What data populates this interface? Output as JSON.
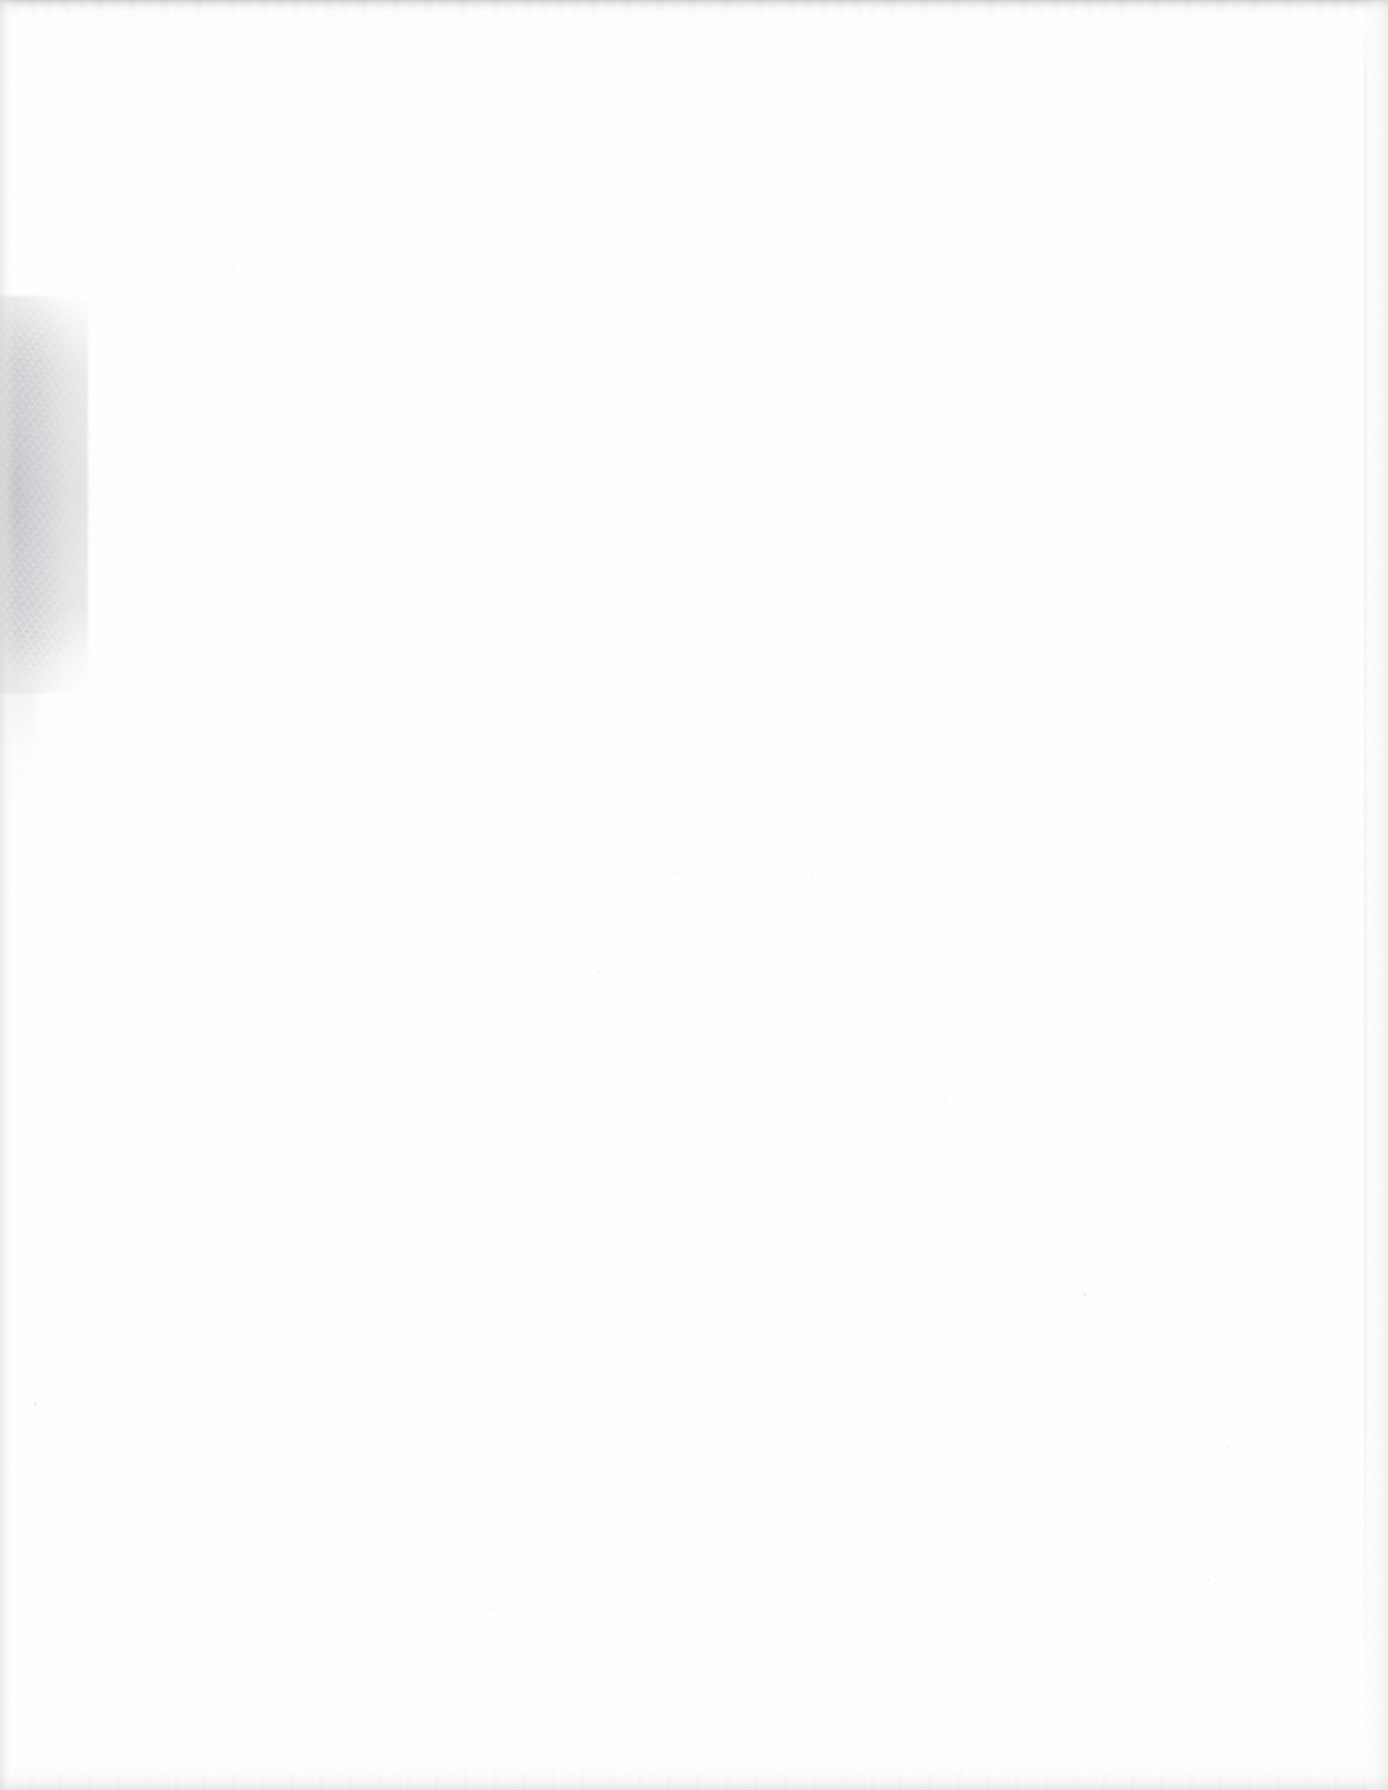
{
  "document": {
    "kind": "scanned-page",
    "page_state": "blank",
    "visible_text": "",
    "caption": "Blank scanned page",
    "dimensions": {
      "width_px": 1388,
      "height_px": 1790
    }
  },
  "colors": {
    "page_background": "#fefefe",
    "paper_white": "#ffffff",
    "edge_band": "#ececec",
    "edge_band_dark": "#c6c6c6",
    "smudge_gray": "#d6d6d8",
    "smudge_core_gray": "#b2b2b8",
    "speck_gray": "#dedede",
    "vignette_gray": "#f7f7f7"
  },
  "artifacts": [
    {
      "name": "top-edge-band",
      "description": "Light gray scan edge band across the top of the page",
      "x": 0,
      "y": 0,
      "width": 1388,
      "height": 14
    },
    {
      "name": "bottom-edge-band",
      "description": "Faint gray scan edge band across the bottom of the page",
      "x": 0,
      "y": 1764,
      "width": 1388,
      "height": 26
    },
    {
      "name": "left-edge-line",
      "description": "Faint vertical gray line along the left margin",
      "x": 0,
      "y": 0,
      "width": 16,
      "height": 1790
    },
    {
      "name": "right-edge-line",
      "description": "Faint vertical gray line along the right margin",
      "x": 1358,
      "y": 0,
      "width": 30,
      "height": 1790
    },
    {
      "name": "left-margin-smudge",
      "description": "Soft mottled gray shadow blotch on the left margin of the scanned page",
      "x": 0,
      "y": 300,
      "width": 88,
      "height": 390
    }
  ],
  "specks": [
    {
      "x": 1083,
      "y": 1293,
      "size": 3
    },
    {
      "x": 34,
      "y": 1402,
      "size": 3
    },
    {
      "x": 36,
      "y": 1500,
      "size": 2
    },
    {
      "x": 232,
      "y": 270,
      "size": 2
    },
    {
      "x": 458,
      "y": 272,
      "size": 2
    },
    {
      "x": 396,
      "y": 1398,
      "size": 2
    },
    {
      "x": 676,
      "y": 872,
      "size": 2
    },
    {
      "x": 810,
      "y": 872,
      "size": 2
    },
    {
      "x": 598,
      "y": 970,
      "size": 2
    },
    {
      "x": 452,
      "y": 1018,
      "size": 2
    },
    {
      "x": 398,
      "y": 1090,
      "size": 2
    },
    {
      "x": 1140,
      "y": 940,
      "size": 2
    },
    {
      "x": 944,
      "y": 1096,
      "size": 2
    },
    {
      "x": 1252,
      "y": 1106,
      "size": 2
    },
    {
      "x": 786,
      "y": 1420,
      "size": 2
    },
    {
      "x": 1226,
      "y": 1446,
      "size": 2
    },
    {
      "x": 724,
      "y": 1558,
      "size": 2
    },
    {
      "x": 1208,
      "y": 1578,
      "size": 2
    },
    {
      "x": 492,
      "y": 1608,
      "size": 2
    },
    {
      "x": 112,
      "y": 1808,
      "size": 2
    }
  ]
}
